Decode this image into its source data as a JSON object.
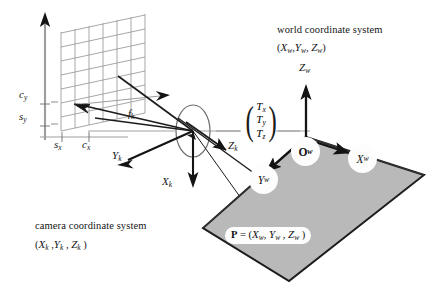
{
  "figure": {
    "title_world": "world coordinate system",
    "tuple_world": "(X_w ,Y_w , Z_w )",
    "title_camera": "camera coordinate system",
    "tuple_camera": "(X_k ,Y_k , Z_k )"
  },
  "world": {
    "axis_z_label": "Z_w",
    "badge_origin": "O_w",
    "badge_x": "X_w",
    "badge_y": "Y_w",
    "point_label": "P = (X_w , Y_w , Z_w )"
  },
  "camera": {
    "axis_x_label": "X_k",
    "axis_y_label": "Y_k",
    "axis_z_label": "Z_k",
    "focal_label": "f_k"
  },
  "intrinsics": {
    "center_y": "c_y",
    "scale_y": "s_y",
    "scale_x": "s_x",
    "center_x": "c_x"
  },
  "translation": {
    "row_x": "T_x",
    "row_y": "T_y",
    "row_z": "T_z",
    "paren_open": "(",
    "paren_close": ")"
  },
  "colors": {
    "plane_fill": "#b9b9b9",
    "plane_edge": "#1c1c1c",
    "grid_line": "#9a9a9a",
    "axis_dark": "#141414",
    "axis_gray": "#9a9a9a",
    "background": "#ffffff",
    "badge_fill": "#fdfdfd",
    "text": "#141414"
  }
}
